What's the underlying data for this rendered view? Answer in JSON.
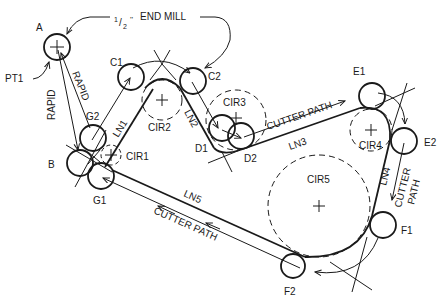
{
  "diagram": {
    "title_note": "END MILL",
    "tool_size": "1/2\"",
    "tool_size_num": "1",
    "tool_size_den": "2",
    "tool_size_mark": "''",
    "points": {
      "A": "A",
      "PT1": "PT1",
      "B": "B",
      "C1": "C1",
      "C2": "C2",
      "D1": "D1",
      "D2": "D2",
      "E1": "E1",
      "E2": "E2",
      "F1": "F1",
      "F2": "F2",
      "G1": "G1",
      "G2": "G2"
    },
    "circles": {
      "CIR1": "CIR1",
      "CIR2": "CIR2",
      "CIR3": "CIR3",
      "CIR4": "CIR4",
      "CIR5": "CIR5"
    },
    "lines": {
      "LN1": "LN1",
      "LN2": "LN2",
      "LN3": "LN3",
      "LN4": "LN4",
      "LN5": "LN5"
    },
    "annotations": {
      "rapid_down": "RAPID",
      "rapid_up": "RAPID",
      "cutter_path_top": "CUTTER PATH",
      "cutter_path_right_1": "CUTTER",
      "cutter_path_right_2": "PATH",
      "cutter_path_bottom": "CUTTER PATH"
    }
  }
}
